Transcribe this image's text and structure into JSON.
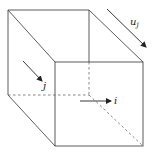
{
  "diagram": {
    "type": "oblique cube with vectors",
    "labels": {
      "u_j": "u",
      "u_j_sub": "j",
      "j": "j",
      "i": "i"
    },
    "colors": {
      "line": "#333333",
      "background": "#ffffff"
    }
  }
}
